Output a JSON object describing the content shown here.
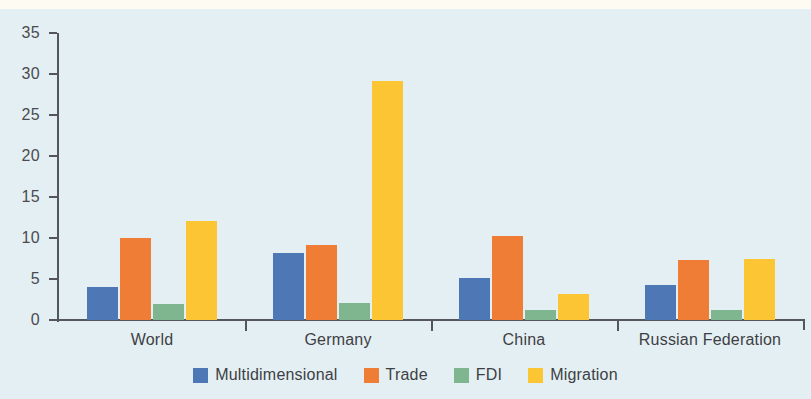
{
  "chart_data": {
    "type": "bar",
    "title": "",
    "subtitle": "",
    "xlabel": "",
    "ylabel": "",
    "categories": [
      "World",
      "Germany",
      "China",
      "Russian Federation"
    ],
    "series": [
      {
        "name": "Multidimensional",
        "color": "#4e77b6",
        "values": [
          4.0,
          8.2,
          5.1,
          4.3
        ]
      },
      {
        "name": "Trade",
        "color": "#ef7d35",
        "values": [
          10.0,
          9.2,
          10.2,
          7.3
        ]
      },
      {
        "name": "FDI",
        "color": "#80b68f",
        "values": [
          2.0,
          2.1,
          1.2,
          1.2
        ]
      },
      {
        "name": "Migration",
        "color": "#fcc533",
        "values": [
          12.1,
          29.1,
          3.2,
          7.4
        ]
      }
    ],
    "ylim": [
      0,
      35
    ],
    "yticks": [
      0,
      5,
      10,
      15,
      20,
      25,
      30,
      35
    ],
    "ytick_labels": [
      "0",
      "5",
      "10",
      "15",
      "20",
      "25",
      "30",
      "35"
    ],
    "grid": false,
    "legend_position": "bottom",
    "background_color": "#e4eff3",
    "axis_color": "#55565a"
  }
}
